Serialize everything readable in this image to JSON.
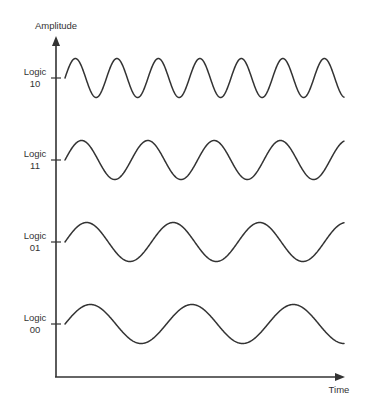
{
  "diagram": {
    "axes": {
      "y_label": "Amplitude",
      "x_label": "Time",
      "color": "#333333"
    },
    "signals": [
      {
        "logic_word": "Logic",
        "logic_value": "10",
        "cycles_shown": 7,
        "relative_frequency": "highest"
      },
      {
        "logic_word": "Logic",
        "logic_value": "11",
        "cycles_shown": 4.25,
        "relative_frequency": "high"
      },
      {
        "logic_word": "Logic",
        "logic_value": "01",
        "cycles_shown": 3.25,
        "relative_frequency": "low"
      },
      {
        "logic_word": "Logic",
        "logic_value": "00",
        "cycles_shown": 2.75,
        "relative_frequency": "lowest"
      }
    ]
  },
  "layout": {
    "origin": {
      "x": 56,
      "y": 377
    },
    "y_axis_top": 36,
    "x_axis_right": 345,
    "wave_start_x": 65,
    "wave_end_x": 344,
    "amplitude_px": 19.5,
    "waves": [
      {
        "mid_y": 78,
        "period_px": 41.5
      },
      {
        "mid_y": 160,
        "period_px": 66.3
      },
      {
        "mid_y": 242,
        "period_px": 86.5
      },
      {
        "mid_y": 324,
        "period_px": 101.5
      }
    ]
  }
}
